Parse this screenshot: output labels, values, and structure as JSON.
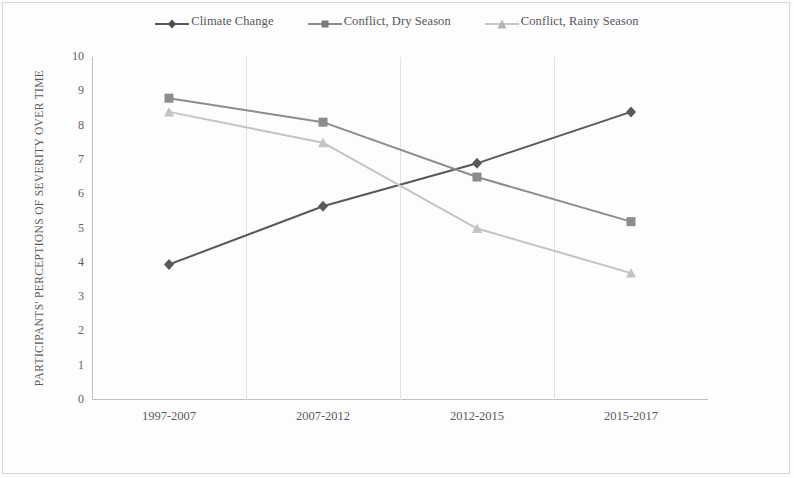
{
  "chart_data": {
    "type": "line",
    "title": "",
    "xlabel": "",
    "ylabel": "PARTICIPANTS' PERCEPTIONS OF SEVERITY OVER TIME",
    "categories": [
      "1997-2007",
      "2007-2012",
      "2012-2015",
      "2015-2017"
    ],
    "ylim": [
      0,
      10
    ],
    "yticks": [
      "0",
      "1",
      "2",
      "3",
      "4",
      "5",
      "6",
      "7",
      "8",
      "9",
      "10"
    ],
    "grid": "vertical-only",
    "legend_position": "top-center",
    "series": [
      {
        "name": "Climate Change",
        "marker": "diamond",
        "color": "#595959",
        "values": [
          3.95,
          5.65,
          6.9,
          8.4
        ]
      },
      {
        "name": "Conflict, Dry Season",
        "marker": "square",
        "color": "#8c8c8c",
        "values": [
          8.8,
          8.1,
          6.5,
          5.2
        ]
      },
      {
        "name": "Conflict, Rainy Season",
        "marker": "triangle",
        "color": "#c3c3c3",
        "values": [
          8.4,
          7.5,
          5.0,
          3.7
        ]
      }
    ]
  },
  "legend": {
    "items": [
      {
        "label": "Climate Change",
        "marker_icon": "diamond-marker-icon"
      },
      {
        "label": "Conflict, Dry Season",
        "marker_icon": "square-marker-icon"
      },
      {
        "label": "Conflict, Rainy Season",
        "marker_icon": "triangle-marker-icon"
      }
    ]
  }
}
